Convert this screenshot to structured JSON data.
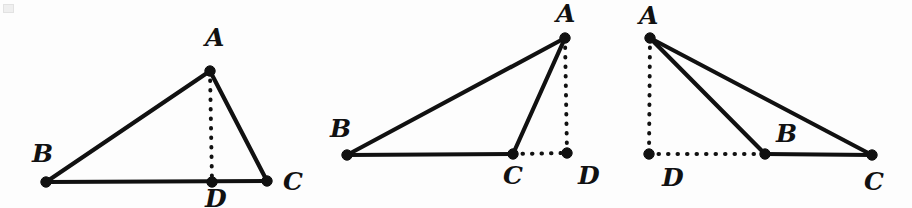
{
  "figure": {
    "background_color": "#fdfdfd",
    "ink_color": "#111111",
    "panel_count": 3
  },
  "chart_data": {
    "type": "diagram",
    "xlabel": "",
    "ylabel": "",
    "panels": [
      {
        "name": "acute-case",
        "caption": "Foot of altitude D lies between B and C",
        "points": {
          "A": {
            "x": 210,
            "y": 71
          },
          "B": {
            "x": 46,
            "y": 182
          },
          "C": {
            "x": 267,
            "y": 181
          },
          "D": {
            "x": 212,
            "y": 182
          }
        },
        "solid_segments": [
          [
            "A",
            "B"
          ],
          [
            "A",
            "C"
          ],
          [
            "B",
            "C"
          ]
        ],
        "dotted_segments": [
          [
            "A",
            "D"
          ]
        ],
        "labels": [
          {
            "text": "A",
            "x": 205,
            "y": 46
          },
          {
            "text": "B",
            "x": 32,
            "y": 162
          },
          {
            "text": "C",
            "x": 283,
            "y": 190
          },
          {
            "text": "D",
            "x": 205,
            "y": 207
          }
        ]
      },
      {
        "name": "obtuse-at-c-case",
        "caption": "Foot of altitude D lies outside BC beyond C",
        "points": {
          "A": {
            "x": 565,
            "y": 38
          },
          "B": {
            "x": 347,
            "y": 155
          },
          "C": {
            "x": 513,
            "y": 154
          },
          "D": {
            "x": 567,
            "y": 153
          }
        },
        "solid_segments": [
          [
            "A",
            "B"
          ],
          [
            "A",
            "C"
          ],
          [
            "B",
            "C"
          ]
        ],
        "dotted_segments": [
          [
            "A",
            "D"
          ],
          [
            "C",
            "D"
          ]
        ],
        "labels": [
          {
            "text": "A",
            "x": 556,
            "y": 22
          },
          {
            "text": "B",
            "x": 330,
            "y": 137
          },
          {
            "text": "C",
            "x": 503,
            "y": 184
          },
          {
            "text": "D",
            "x": 578,
            "y": 184
          }
        ]
      },
      {
        "name": "obtuse-at-b-case",
        "caption": "Foot of altitude D lies outside BC beyond B",
        "points": {
          "A": {
            "x": 650,
            "y": 38
          },
          "B": {
            "x": 765,
            "y": 154
          },
          "C": {
            "x": 872,
            "y": 155
          },
          "D": {
            "x": 649,
            "y": 154
          }
        },
        "solid_segments": [
          [
            "A",
            "B"
          ],
          [
            "A",
            "C"
          ],
          [
            "B",
            "C"
          ]
        ],
        "dotted_segments": [
          [
            "A",
            "D"
          ],
          [
            "D",
            "B"
          ]
        ],
        "labels": [
          {
            "text": "A",
            "x": 639,
            "y": 24
          },
          {
            "text": "B",
            "x": 776,
            "y": 142
          },
          {
            "text": "C",
            "x": 864,
            "y": 190
          },
          {
            "text": "D",
            "x": 662,
            "y": 186
          }
        ]
      }
    ],
    "vertex_radius": 5.2,
    "solid_stroke_width": 4.2,
    "dotted_stroke_width": 4.0
  }
}
